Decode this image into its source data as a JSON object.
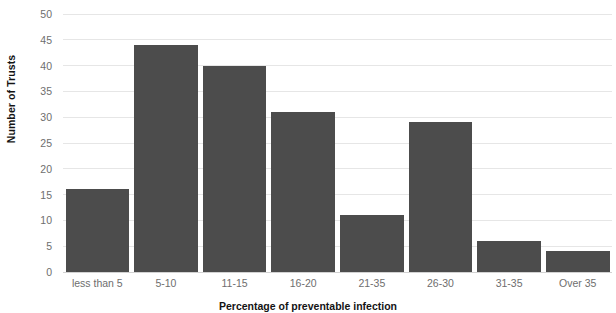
{
  "chart_data": {
    "type": "bar",
    "title": "",
    "xlabel": "Percentage of preventable infection",
    "ylabel": "Number of Trusts",
    "categories": [
      "less than 5",
      "5-10",
      "11-15",
      "16-20",
      "21-35",
      "26-30",
      "31-35",
      "Over 35"
    ],
    "values": [
      16,
      44,
      40,
      31,
      11,
      29,
      6,
      4
    ],
    "ylim": [
      0,
      50
    ],
    "yticks": [
      0,
      5,
      10,
      15,
      20,
      25,
      30,
      35,
      40,
      45,
      50
    ],
    "ytick_labels": [
      "0",
      "5",
      "10",
      "15",
      "20",
      "25",
      "30",
      "35",
      "40",
      "45",
      "50"
    ],
    "grid": true,
    "grid_axis": "y",
    "legend": false,
    "legend_position": "none",
    "series": [
      {
        "name": "Number of Trusts",
        "values": [
          16,
          44,
          40,
          31,
          11,
          29,
          6,
          4
        ],
        "color": "#4c4c4c"
      }
    ]
  },
  "colors": {
    "bar_fill": "#4c4c4c",
    "gridline": "#e6e6e6",
    "baseline": "#d2d2d2",
    "background": "#ffffff",
    "tick_label": "#6e6e6e",
    "axis_title": "#141414"
  }
}
